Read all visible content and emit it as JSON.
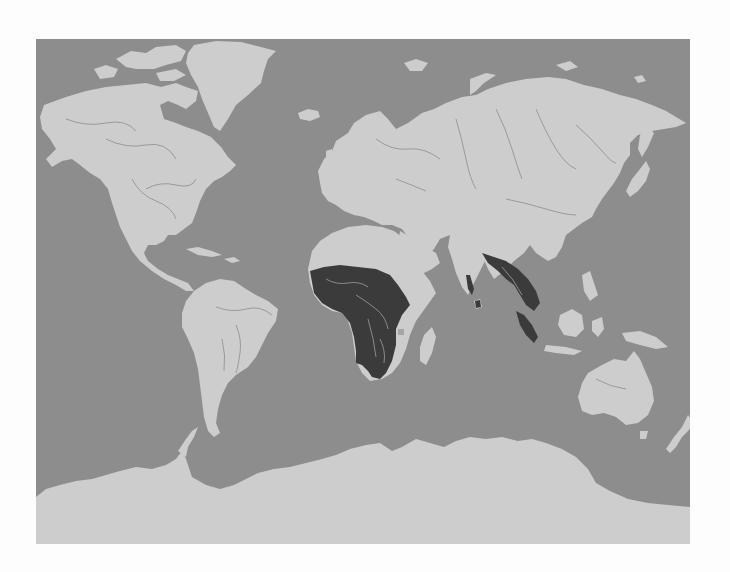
{
  "map": {
    "type": "world-distribution-map",
    "projection": "cylindrical (Miller-like)",
    "colors": {
      "page_background": "#fdfdfd",
      "ocean": "#8d8d8d",
      "land": "#cdcdcd",
      "rivers": "#9a9a9a",
      "highlighted_range": "#3b3b3b",
      "highlighted_rivers": "#8a8a8a"
    },
    "highlighted_regions": [
      {
        "name": "Sub-Saharan Africa"
      },
      {
        "name": "India (Western Ghats / Sri Lanka)"
      },
      {
        "name": "Northeast India, Bangladesh, Myanmar"
      },
      {
        "name": "Indochina (Thailand, Laos, Cambodia, Vietnam)"
      },
      {
        "name": "Malay Peninsula and Sumatra"
      }
    ],
    "continents": [
      "North America",
      "Greenland",
      "South America",
      "Europe",
      "Asia",
      "Africa",
      "Madagascar",
      "Australia",
      "New Zealand",
      "Antarctica"
    ]
  }
}
